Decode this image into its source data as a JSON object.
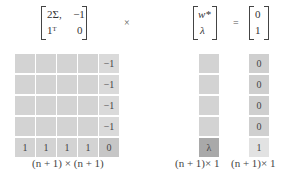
{
  "equation": {
    "matrix": {
      "row1": [
        "2Σ,",
        "−1"
      ],
      "row2": [
        "1ᵀ",
        "0"
      ]
    },
    "times": "×",
    "unknown": {
      "row1": "w*",
      "row2": "λ"
    },
    "equals": "=",
    "rhs": {
      "row1": "0",
      "row2": "1"
    }
  },
  "grid": {
    "matrix_cells": [
      [
        "",
        "",
        "",
        "",
        "−1"
      ],
      [
        "",
        "",
        "",
        "",
        "−1"
      ],
      [
        "",
        "",
        "",
        "",
        "−1"
      ],
      [
        "",
        "",
        "",
        "",
        "−1"
      ],
      [
        "1",
        "1",
        "1",
        "1",
        "0"
      ]
    ],
    "unknown_cells": [
      "",
      "",
      "",
      "",
      "λ"
    ],
    "rhs_cells": [
      "0",
      "0",
      "0",
      "0",
      "1"
    ],
    "matrix_dim": "(n + 1) × (n + 1)",
    "unknown_dim": "(n + 1)× 1",
    "rhs_dim": "(n + 1)× 1"
  },
  "colors": {
    "cell": "#d3d3d3",
    "lambda_cell": "#a9a9a9",
    "rhs_one_cell": "#e2e2e2"
  }
}
